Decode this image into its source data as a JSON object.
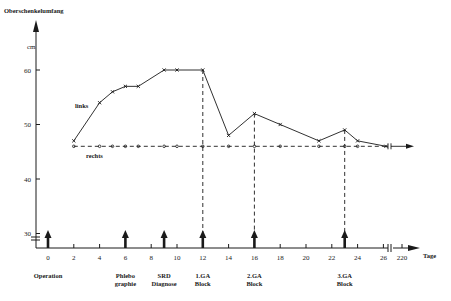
{
  "chart_data": {
    "type": "line",
    "title": "",
    "ylabel": "Oberschenkelumfang",
    "yunit": "cm",
    "xlabel": "Tage",
    "ylim": [
      30,
      62
    ],
    "yticks": [
      30,
      40,
      50,
      60
    ],
    "xticks": [
      "0",
      "2",
      "4",
      "6",
      "8",
      "10",
      "12",
      "14",
      "16",
      "18",
      "20",
      "22",
      "24",
      "26",
      "220"
    ],
    "x_axis_break_between": [
      "26",
      "220"
    ],
    "y_axis_break_below": 30,
    "grid": false,
    "series": [
      {
        "name": "links",
        "style": "solid-cross",
        "x": [
          2,
          4,
          5,
          6,
          7,
          9,
          10,
          12,
          14,
          16,
          18,
          21,
          23,
          24,
          220
        ],
        "values": [
          47,
          54,
          56,
          57,
          57,
          60,
          60,
          60,
          48,
          52,
          50,
          47,
          49,
          47,
          46
        ]
      },
      {
        "name": "rechts",
        "style": "dashed-circle",
        "x": [
          2,
          4,
          5,
          6,
          7,
          9,
          10,
          12,
          14,
          16,
          18,
          21,
          23,
          24,
          220
        ],
        "values": [
          46,
          46,
          46,
          46,
          46,
          46,
          46,
          46,
          46,
          46,
          46,
          46,
          46,
          46,
          46
        ]
      }
    ],
    "events": [
      {
        "day": 0,
        "label_line1": "Operation",
        "label_line2": "",
        "dashed_guide": false
      },
      {
        "day": 6,
        "label_line1": "Phlebo",
        "label_line2": "graphie",
        "dashed_guide": false
      },
      {
        "day": 9,
        "label_line1": "SRD",
        "label_line2": "Diagnose",
        "dashed_guide": false
      },
      {
        "day": 12,
        "label_line1": "1.GA",
        "label_line2": "Block",
        "dashed_guide": true
      },
      {
        "day": 16,
        "label_line1": "2.GA",
        "label_line2": "Block",
        "dashed_guide": true
      },
      {
        "day": 23,
        "label_line1": "3.GA",
        "label_line2": "Block",
        "dashed_guide": true
      }
    ]
  },
  "labels": {
    "y_title": "Oberschenkelumfang",
    "y_unit": "cm",
    "x_unit": "Tage",
    "series_links": "links",
    "series_rechts": "rechts"
  }
}
